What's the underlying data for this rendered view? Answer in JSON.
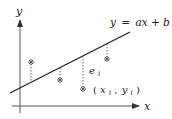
{
  "diagram": {
    "axes": {
      "x_label": "x",
      "y_label": "y"
    },
    "regression_line": {
      "equation_lhs": "y",
      "equation_eq": "=",
      "equation_rhs": "ax + b",
      "start": [
        10,
        93
      ],
      "end": [
        130,
        32
      ]
    },
    "points": [
      {
        "x": 31,
        "y_point": 62,
        "y_line": 82
      },
      {
        "x": 60,
        "y_point": 80,
        "y_line": 68
      },
      {
        "x": 83,
        "y_point": 89,
        "y_line": 56
      },
      {
        "x": 107,
        "y_point": 59,
        "y_line": 44
      }
    ],
    "residual_label": {
      "base": "e",
      "sub": "i"
    },
    "point_label": {
      "open": "(",
      "x_base": "x",
      "x_sub": "i",
      "comma": ",",
      "y_base": "y",
      "y_sub": "i",
      "close": ")"
    },
    "colors": {
      "stroke": "#222222",
      "axis": "#555555",
      "dash": "#555555"
    }
  }
}
